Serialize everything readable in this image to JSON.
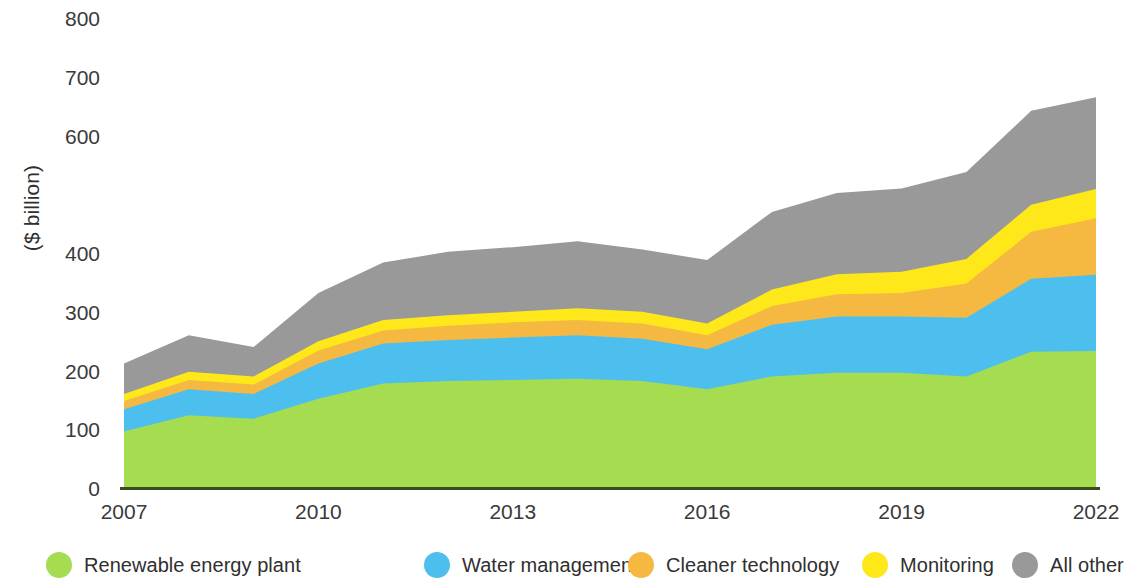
{
  "chart_data": {
    "type": "area",
    "stacked": true,
    "title": "",
    "subtitle": "",
    "xlabel": "",
    "ylabel": "($ billion)",
    "x": [
      2007,
      2008,
      2009,
      2010,
      2011,
      2012,
      2013,
      2014,
      2015,
      2016,
      2017,
      2018,
      2019,
      2020,
      2021,
      2022
    ],
    "xtick_labels": [
      "2007",
      "2010",
      "2013",
      "2016",
      "2019",
      "2022"
    ],
    "xtick_values": [
      2007,
      2010,
      2013,
      2016,
      2019,
      2022
    ],
    "ytick_labels": [
      "800",
      "700",
      "600",
      "",
      "400",
      "300",
      "200",
      "100",
      "0"
    ],
    "ytick_values": [
      800,
      700,
      600,
      500,
      400,
      300,
      200,
      100,
      0
    ],
    "xlim": [
      2007,
      2022
    ],
    "ylim": [
      0,
      800
    ],
    "grid": false,
    "legend_position": "bottom",
    "note_missing_tick_label": "500",
    "series": [
      {
        "name": "Renewable energy plant",
        "color": "#A5DC50",
        "values": [
          96,
          124,
          118,
          152,
          178,
          182,
          184,
          186,
          182,
          168,
          190,
          196,
          196,
          190,
          232,
          233
        ]
      },
      {
        "name": "Water management",
        "color": "#4DBFEE",
        "values": [
          38,
          44,
          42,
          60,
          68,
          70,
          72,
          74,
          72,
          68,
          88,
          96,
          96,
          100,
          124,
          130
        ]
      },
      {
        "name": "Cleaner technology",
        "color": "#F5B942",
        "values": [
          14,
          16,
          16,
          22,
          22,
          24,
          26,
          26,
          26,
          24,
          32,
          38,
          40,
          58,
          80,
          96
        ]
      },
      {
        "name": "Monitoring",
        "color": "#FFE81A",
        "values": [
          12,
          14,
          14,
          16,
          18,
          18,
          18,
          20,
          20,
          20,
          28,
          34,
          36,
          42,
          46,
          50
        ]
      },
      {
        "name": "All other",
        "color": "#999999",
        "values": [
          52,
          62,
          50,
          82,
          98,
          108,
          110,
          114,
          106,
          108,
          132,
          138,
          142,
          148,
          160,
          156
        ]
      }
    ],
    "totals": [
      212,
      260,
      240,
      332,
      384,
      402,
      410,
      420,
      406,
      388,
      470,
      502,
      510,
      538,
      642,
      665
    ]
  },
  "legend": {
    "items": [
      {
        "label": "Renewable energy plant",
        "color": "#A5DC50"
      },
      {
        "label": "Water management",
        "color": "#4DBFEE"
      },
      {
        "label": "Cleaner technology",
        "color": "#F5B942"
      },
      {
        "label": "Monitoring",
        "color": "#FFE81A"
      },
      {
        "label": "All other",
        "color": "#999999"
      }
    ]
  },
  "axis": {
    "baseline_color": "#3d4a1e"
  }
}
